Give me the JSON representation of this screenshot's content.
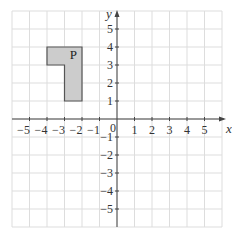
{
  "diagram": {
    "type": "coordinate-grid",
    "x_axis": {
      "label": "x",
      "min": -6,
      "max": 6,
      "tick_labels": [
        "−5",
        "−4",
        "−3",
        "−2",
        "−1",
        "1",
        "2",
        "3",
        "4",
        "5"
      ],
      "ticks": [
        -5,
        -4,
        -3,
        -2,
        -1,
        1,
        2,
        3,
        4,
        5
      ]
    },
    "y_axis": {
      "label": "y",
      "min": -6,
      "max": 6,
      "tick_labels": [
        "5",
        "4",
        "3",
        "2",
        "1",
        "−1",
        "−2",
        "−3",
        "−4",
        "−5"
      ],
      "ticks": [
        5,
        4,
        3,
        2,
        1,
        -1,
        -2,
        -3,
        -4,
        -5
      ]
    },
    "origin_label": "0",
    "shape": {
      "label": "P",
      "vertices": [
        [
          -4,
          4
        ],
        [
          -2,
          4
        ],
        [
          -2,
          1
        ],
        [
          -3,
          1
        ],
        [
          -3,
          3
        ],
        [
          -4,
          3
        ]
      ],
      "fill": "#cccccc",
      "stroke": "#555555"
    },
    "colors": {
      "grid": "#dddddd",
      "axis": "#444444"
    }
  }
}
